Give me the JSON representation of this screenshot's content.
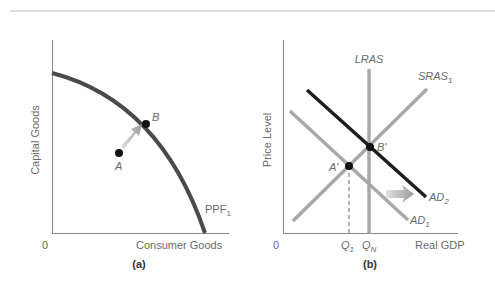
{
  "panel_a": {
    "caption": "(a)",
    "y_axis_label": "Capital Goods",
    "x_axis_label": "Consumer Goods",
    "origin_label": "0",
    "curve_label": "PPF",
    "curve_label_sub": "1",
    "point_a_label": "A",
    "point_b_label": "B"
  },
  "panel_b": {
    "caption": "(b)",
    "y_axis_label": "Price Level",
    "x_axis_label": "Real GDP",
    "origin_label": "0",
    "lras_label": "LRAS",
    "sras_label": "SRAS",
    "sras_sub": "1",
    "ad1_label": "AD",
    "ad1_sub": "1",
    "ad2_label": "AD",
    "ad2_sub": "2",
    "point_a_label": "A'",
    "point_b_label": "B'",
    "q1_label": "Q",
    "q1_sub": "1",
    "qn_label": "Q",
    "qn_sub": "N"
  },
  "colors": {
    "axis": "#8a8a8a",
    "ppf": "#4a4a4a",
    "light_curve": "#a8a8a8",
    "ad2": "#1e1e1e",
    "point": "#111111",
    "arrow": "#b0b0b0",
    "text": "#6a6a6a"
  }
}
